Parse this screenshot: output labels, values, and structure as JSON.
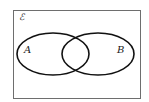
{
  "diagram": {
    "type": "venn",
    "universal_set": {
      "label": "ℰ",
      "rect": {
        "x": 13,
        "y": 10,
        "width": 127,
        "height": 88
      },
      "stroke": "#6e6e6e"
    },
    "sets": [
      {
        "label": "A",
        "cx": 53,
        "cy": 54,
        "rx": 36,
        "ry": 21,
        "label_x": 27,
        "label_y": 53
      },
      {
        "label": "B",
        "cx": 98,
        "cy": 54,
        "rx": 36,
        "ry": 21,
        "label_x": 119,
        "label_y": 53
      }
    ],
    "stroke": "#111111"
  }
}
